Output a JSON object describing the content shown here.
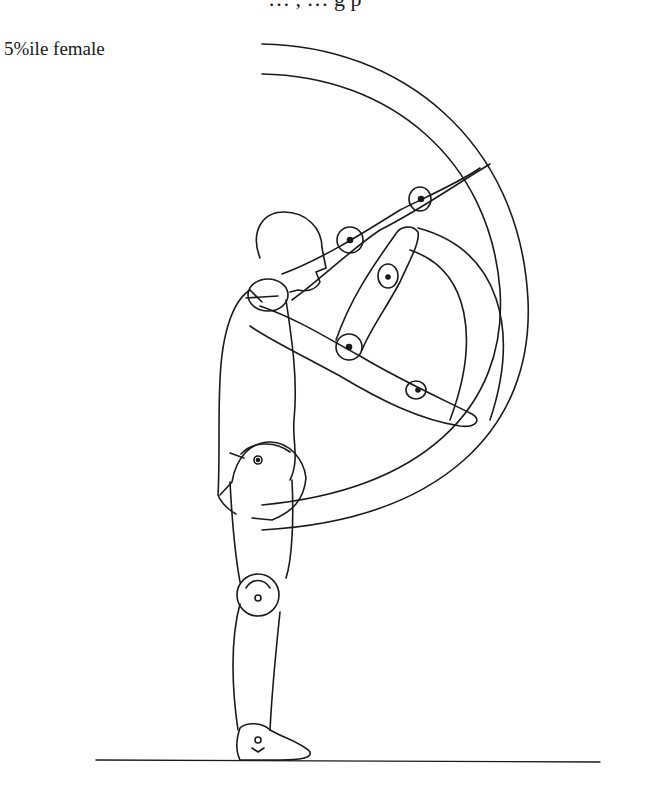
{
  "figure": {
    "label": "5%ile female",
    "top_clipped_text": "… , … g p",
    "colors": {
      "ink": "#1a1a1a",
      "background": "#ffffff"
    }
  }
}
